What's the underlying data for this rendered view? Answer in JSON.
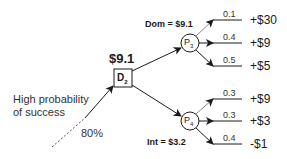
{
  "decision_node": {
    "label": "D",
    "subscript": "2",
    "value": "$9.1"
  },
  "entry": {
    "text_line1": "High probability",
    "text_line2": "of success",
    "probability": "80%"
  },
  "chance_nodes": [
    {
      "label": "P",
      "subscript": "3",
      "annotation": "Dom = $9.1",
      "branches": [
        {
          "prob": "0.1",
          "payoff": "+$30"
        },
        {
          "prob": "0.4",
          "payoff": "+$9"
        },
        {
          "prob": "0.5",
          "payoff": "+$5"
        }
      ]
    },
    {
      "label": "P",
      "subscript": "4",
      "annotation": "Int = $3.2",
      "branches": [
        {
          "prob": "0.3",
          "payoff": "+$9"
        },
        {
          "prob": "0.3",
          "payoff": "+$3"
        },
        {
          "prob": "0.4",
          "payoff": "-$1"
        }
      ]
    }
  ]
}
